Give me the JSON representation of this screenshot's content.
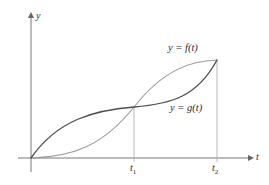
{
  "figure": {
    "type": "math-graph",
    "background_color": "#ffffff",
    "axes": {
      "x_label": "t",
      "y_label": "y",
      "x_axis_color": "#666666",
      "y_axis_color": "#666666",
      "origin_px": [
        31,
        158
      ],
      "x_axis_start_px": [
        18,
        158
      ],
      "x_axis_end_px": [
        252,
        158
      ],
      "y_axis_top_px": [
        31,
        14
      ],
      "y_axis_bottom_px": [
        31,
        172
      ],
      "arrowheads": [
        "x-positive",
        "y-positive"
      ]
    },
    "ticks": [
      {
        "name": "t1",
        "label": "t",
        "subscript": "1",
        "x_px": 134
      },
      {
        "name": "t2",
        "label": "t",
        "subscript": "2",
        "x_px": 217
      }
    ],
    "guide_lines": [
      {
        "name": "t1-vertical",
        "x_px": 134,
        "y_top_px": 107,
        "y_bottom_px": 158,
        "color": "#aaaaaa"
      },
      {
        "name": "t2-vertical",
        "x_px": 217,
        "y_top_px": 60,
        "y_bottom_px": 158,
        "color": "#aaaaaa"
      }
    ],
    "curves": [
      {
        "name": "curve-f",
        "label": "y = f(t)",
        "color": "#9a9a9a",
        "width": 1.1,
        "shape": "convex-then-concave (S-curve, starts flat, rises steeply, levels at t2)",
        "path": "M 31 158 C 75 156, 105 144, 134 107 C 163 70, 190 61, 217 60"
      },
      {
        "name": "curve-g",
        "label": "y = g(t)",
        "color": "#4d4d4d",
        "width": 1.3,
        "shape": "concave-then-convex (rises steeply, flattens near t1, rises again to t2)",
        "path": "M 31 158 C 60 120, 95 110, 134 107 C 170 104, 196 96, 217 60"
      }
    ],
    "labels": {
      "f_label": "y = f(t)",
      "g_label": "y = g(t)",
      "y_axis": "y",
      "t_axis": "t",
      "t1_base": "t",
      "t1_sub": "1",
      "t2_base": "t",
      "t2_sub": "2"
    }
  }
}
